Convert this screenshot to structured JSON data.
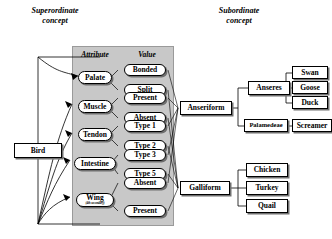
{
  "headings": {
    "superordinate": "Superordinate\nconcept",
    "subordinate": "Subordinate\nconcept"
  },
  "column_labels": {
    "attribute": "Attribute",
    "value": "Value"
  },
  "root": {
    "label": "Bird"
  },
  "attributes": [
    {
      "label": "Palate"
    },
    {
      "label": "Muscle"
    },
    {
      "label": "Tendon"
    },
    {
      "label": "Intestine"
    },
    {
      "label": "Wing",
      "sub": "(4th secondary)"
    }
  ],
  "values": [
    {
      "label": "Bonded"
    },
    {
      "label": "Split"
    },
    {
      "label": "Present"
    },
    {
      "label": "Absent"
    },
    {
      "label": "Type 1"
    },
    {
      "label": "Type 2"
    },
    {
      "label": "Type 3"
    },
    {
      "label": "Type 5"
    },
    {
      "label": "Absent"
    },
    {
      "label": "Present"
    }
  ],
  "orders": [
    {
      "label": "Anseriform"
    },
    {
      "label": "Galliform"
    }
  ],
  "suborders": [
    {
      "label": "Anseres"
    },
    {
      "label": "Palamedeae"
    }
  ],
  "species": [
    {
      "label": "Swan"
    },
    {
      "label": "Goose"
    },
    {
      "label": "Duck"
    },
    {
      "label": "Screamer"
    },
    {
      "label": "Chicken"
    },
    {
      "label": "Turkey"
    },
    {
      "label": "Quail"
    }
  ],
  "colors": {
    "panel_fill": "#c8c8c8",
    "panel_stroke": "#9a9a9a",
    "node_fill": "#ffffff",
    "node_stroke": "#000000",
    "shadow": "#707070",
    "line": "#000000"
  }
}
